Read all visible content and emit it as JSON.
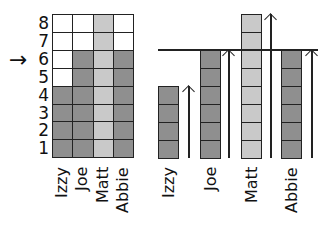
{
  "left_chart": {
    "y_ticks": [
      "1",
      "2",
      "3",
      "4",
      "5",
      "6",
      "7",
      "8"
    ],
    "marker": {
      "symbol": "→",
      "at_value": 6
    },
    "columns": [
      {
        "name": "Izzy",
        "value": 4,
        "color": "#8f8f8f"
      },
      {
        "name": "Joe",
        "value": 6,
        "color": "#8f8f8f"
      },
      {
        "name": "Matt",
        "value": 8,
        "color": "#c9c9c9"
      },
      {
        "name": "Abbie",
        "value": 6,
        "color": "#8f8f8f"
      }
    ]
  },
  "right_chart": {
    "reference_line_value": 6,
    "bars": [
      {
        "name": "Izzy",
        "value": 4,
        "color": "#8f8f8f"
      },
      {
        "name": "Joe",
        "value": 6,
        "color": "#8f8f8f"
      },
      {
        "name": "Matt",
        "value": 8,
        "color": "#c9c9c9"
      },
      {
        "name": "Abbie",
        "value": 6,
        "color": "#8f8f8f"
      }
    ]
  },
  "chart_data": [
    {
      "type": "bar",
      "title": "",
      "categories": [
        "Izzy",
        "Joe",
        "Matt",
        "Abbie"
      ],
      "values": [
        4,
        6,
        8,
        6
      ],
      "xlabel": "",
      "ylabel": "",
      "ylim": [
        0,
        8
      ],
      "y_ticks": [
        1,
        2,
        3,
        4,
        5,
        6,
        7,
        8
      ],
      "grid": true,
      "annotations": [
        "arrow pointing at 6"
      ]
    },
    {
      "type": "bar",
      "title": "",
      "categories": [
        "Izzy",
        "Joe",
        "Matt",
        "Abbie"
      ],
      "values": [
        4,
        6,
        8,
        6
      ],
      "annotations": [
        "horizontal reference line at 6",
        "upward arrows beside each bar"
      ]
    }
  ]
}
